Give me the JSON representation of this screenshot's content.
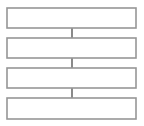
{
  "diagram": {
    "type": "flowchart",
    "orientation": "vertical",
    "title": "",
    "canvas": {
      "width": 144,
      "height": 126,
      "background_color": "#ffffff"
    },
    "style": {
      "box_fill_color": "#ffffff",
      "box_border_color": "#969696",
      "box_border_width": 1.6,
      "connector_color": "#2b2b2b",
      "connector_width": 1.1,
      "arrowhead_color": "#111111",
      "arrowhead_shape": "solid-triangle-down"
    },
    "nodes": [
      {
        "id": "box-1",
        "label": "",
        "x": 7,
        "y": 8,
        "width": 129,
        "height": 20
      },
      {
        "id": "box-2",
        "label": "",
        "x": 7,
        "y": 38,
        "width": 129,
        "height": 20
      },
      {
        "id": "box-3",
        "label": "",
        "x": 7,
        "y": 68,
        "width": 129,
        "height": 20
      },
      {
        "id": "box-4",
        "label": "",
        "x": 7,
        "y": 98,
        "width": 129,
        "height": 21
      }
    ],
    "connectors": [
      {
        "id": "connector-1",
        "from": "box-1",
        "to": "box-2",
        "label": "",
        "line_x": 72,
        "line_y1": 28,
        "line_y2": 50,
        "arrow_tip_y": 50,
        "arrow_top_y": 41,
        "arrow_half_width": 4.5
      },
      {
        "id": "connector-2",
        "from": "box-2",
        "to": "box-3",
        "label": "",
        "line_x": 72,
        "line_y1": 50,
        "line_y2": 80,
        "arrow_tip_y": 80,
        "arrow_top_y": 71,
        "arrow_half_width": 4.5
      },
      {
        "id": "connector-3",
        "from": "box-3",
        "to": "box-4",
        "label": "",
        "line_x": 72,
        "line_y1": 80,
        "line_y2": 110,
        "arrow_tip_y": 110,
        "arrow_top_y": 101,
        "arrow_half_width": 4.5
      }
    ]
  }
}
